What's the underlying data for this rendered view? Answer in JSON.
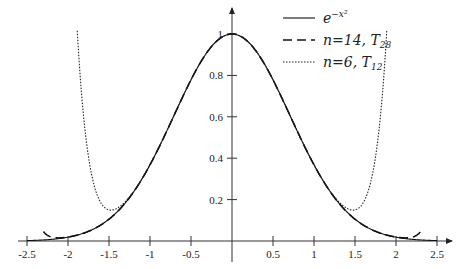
{
  "chart_data": {
    "type": "line",
    "title": "",
    "xlabel": "",
    "ylabel": "",
    "xlim": [
      -2.5,
      2.5
    ],
    "ylim": [
      0,
      1
    ],
    "grid": false,
    "legend_position": "upper right",
    "x_ticks": [
      "-2.5",
      "-2",
      "-1.5",
      "-1",
      "-0.5",
      "0.5",
      "1",
      "1.5",
      "2",
      "2.5"
    ],
    "x_tick_values": [
      -2.5,
      -2,
      -1.5,
      -1,
      -0.5,
      0.5,
      1,
      1.5,
      2,
      2.5
    ],
    "y_ticks": [
      "0.2",
      "0.4",
      "0.6",
      "0.8",
      "1"
    ],
    "y_tick_values": [
      0.2,
      0.4,
      0.6,
      0.8,
      1
    ],
    "series": [
      {
        "name": "e^{-x^2}",
        "label_main": "e",
        "label_sup": "−x²",
        "style": "solid",
        "function": "exp",
        "x": [
          -2.5,
          -2,
          -1.5,
          -1,
          -0.5,
          0,
          0.5,
          1,
          1.5,
          2,
          2.5
        ],
        "values": [
          0.002,
          0.018,
          0.105,
          0.368,
          0.779,
          1.0,
          0.779,
          0.368,
          0.105,
          0.018,
          0.002
        ]
      },
      {
        "name": "n=14, T28",
        "label_main": "n=14, T",
        "label_sub": "28",
        "style": "dashed",
        "function": "taylor",
        "order_n": 14,
        "x": [
          -2.3,
          -2,
          -1.5,
          -1,
          -0.5,
          0,
          0.5,
          1,
          1.5,
          2,
          2.3
        ],
        "values": [
          0.11,
          0.02,
          0.105,
          0.368,
          0.779,
          1.0,
          0.779,
          0.368,
          0.105,
          0.02,
          0.11
        ]
      },
      {
        "name": "n=6, T12",
        "label_main": "n=6, T",
        "label_sub": "12",
        "style": "dotted",
        "function": "taylor",
        "order_n": 6,
        "x": [
          -1.9,
          -1.7,
          -1.55,
          -1.5,
          -1,
          -0.5,
          0,
          0.5,
          1,
          1.5,
          1.55,
          1.7,
          1.9
        ],
        "values": [
          1.02,
          0.4,
          0.17,
          0.17,
          0.368,
          0.779,
          1.0,
          0.779,
          0.368,
          0.17,
          0.17,
          0.4,
          1.02
        ]
      }
    ]
  },
  "layout": {
    "origin_x": 232,
    "origin_y": 241,
    "px_per_x": 82,
    "px_per_y": 207
  }
}
